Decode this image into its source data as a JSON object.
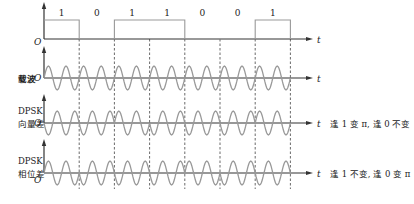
{
  "figure": {
    "width": 414,
    "height": 204,
    "bits": [
      "1",
      "0",
      "1",
      "1",
      "0",
      "0",
      "1"
    ],
    "bit_start_x": 44,
    "bit_width": 35.2,
    "axis_end_x": 313,
    "axis_origin_x": 44,
    "cycles_per_bit": 2,
    "amplitude": 12,
    "colors": {
      "axis": "#333333",
      "wave": "#999999",
      "dashed": "#444444",
      "text": "#222222"
    }
  },
  "rows": [
    {
      "id": "data",
      "label_lines": [],
      "baseline_y": 39,
      "axis_top_y": 2,
      "origin_label": "O",
      "time_label": "t",
      "type": "binary",
      "pulse_height": 19
    },
    {
      "id": "carrier",
      "label_lines": [
        "载波"
      ],
      "baseline_y": 78,
      "axis_top_y": 46,
      "origin_label": "O",
      "time_label": "t",
      "type": "carrier"
    },
    {
      "id": "dpsk-vector",
      "label_lines": [
        "DPSK",
        "向量差"
      ],
      "baseline_y": 123,
      "axis_top_y": 94,
      "origin_label": "O",
      "time_label": "t",
      "type": "dpsk",
      "rule": "flip_on_1",
      "annotation": "逢 1 变 π, 逢 0 不变"
    },
    {
      "id": "dpsk-phase",
      "label_lines": [
        "DPSK",
        "相位差"
      ],
      "baseline_y": 173,
      "axis_top_y": 139,
      "origin_label": "O",
      "time_label": "t",
      "type": "dpsk",
      "rule": "flip_on_0",
      "annotation": "逢 1 不变, 逢 0 变 π"
    }
  ]
}
